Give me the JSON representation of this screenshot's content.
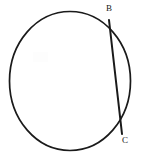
{
  "figure": {
    "kind": "geometry-diagram",
    "width": 152,
    "height": 161,
    "background_color": "#ffffff",
    "stroke_color": "#1a1a1a",
    "label_color": "#171717"
  },
  "circle": {
    "name": "circle-outline",
    "center_x": 70,
    "center_y": 81,
    "radius_x": 60.5,
    "radius_y": 69.5,
    "stroke_width": 1.7,
    "fill": "none"
  },
  "chord": {
    "name": "chord-bc",
    "from": "B",
    "to": "C",
    "x1": 109,
    "y1": 20,
    "x2": 122,
    "y2": 134,
    "stroke_width": 2
  },
  "points": [
    {
      "id": "B",
      "label": "B",
      "x": 109,
      "y": 20,
      "label_x": 106,
      "label_y": 4,
      "position": "upper-right"
    },
    {
      "id": "C",
      "label": "C",
      "x": 122,
      "y": 134,
      "label_x": 122,
      "label_y": 136,
      "position": "lower-right"
    }
  ],
  "chart_data": {
    "type": "diagram",
    "elements": [
      "circle",
      "chord BC",
      "label B",
      "label C"
    ]
  }
}
